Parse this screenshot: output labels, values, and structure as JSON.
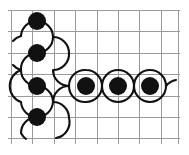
{
  "figure": {
    "type": "geometric-diagram",
    "canvas": {
      "width": 189,
      "height": 155,
      "background": "#ffffff"
    },
    "grid": {
      "line_color": "#9a9a9a",
      "line_width": 1,
      "cell_size": 21.4,
      "origin_x": 11.5,
      "origin_y": 10.5,
      "columns": 8,
      "rows": 6,
      "x_positions": [
        11.5,
        32.9,
        54.3,
        75.7,
        97.1,
        118.5,
        139.9,
        161.3,
        178.0
      ],
      "y_positions": [
        10.5,
        31.9,
        53.3,
        74.7,
        96.1,
        117.5,
        138.9
      ]
    },
    "curve": {
      "stroke_color": "#111111",
      "stroke_width": 2.1,
      "arc_radius": 16.0,
      "description": "Chain of semicircular arcs alternating above and below, forming a serpentine path"
    },
    "dots": {
      "fill_color": "#111111",
      "radius": 9.0,
      "count": 7,
      "positions": [
        {
          "label": "dot-1",
          "x": 37,
          "y": 21
        },
        {
          "label": "dot-2",
          "x": 37,
          "y": 53
        },
        {
          "label": "dot-3",
          "x": 37,
          "y": 86
        },
        {
          "label": "dot-4",
          "x": 37,
          "y": 117
        },
        {
          "label": "dot-5",
          "x": 86,
          "y": 86
        },
        {
          "label": "dot-6",
          "x": 118,
          "y": 86
        },
        {
          "label": "dot-7",
          "x": 150,
          "y": 86
        }
      ]
    },
    "paths": {
      "vertical_serpentine_left": "M 21 36 A 16 16 0 0 1 37 21 A 16 16 0 0 1 53 37 A 16 16 0 0 1 37 53 A 16 16 0 0 0 21 70 A 16 16 0 0 0 37 86 A 16 16 0 0 1 53 102 A 16 16 0 0 1 37 117 A 16 16 0 0 0 21 133 A 16 16 0 0 0 26 139",
      "vertical_serpentine_right": "M 53 37 A 16 16 0 0 1 69 53 A 16 16 0 0 1 53 70 A 16 16 0 0 0 69 86 A 16 16 0 0 0 53 102 A 16 16 0 0 1 69 118 A 16 16 0 0 1 56 138",
      "horizontal_wave_top": "M 69 86 A 16 16 0 0 1 86 70 A 16 16 0 0 1 102 86 A 16 16 0 0 1 118 70 A 16 16 0 0 1 134 86 A 16 16 0 0 1 150 70 A 16 16 0 0 1 166 86 A 16 16 0 0 1 176 80",
      "horizontal_wave_bottom": "M 69 86 A 16 16 0 0 0 86 102 A 16 16 0 0 0 102 86 A 16 16 0 0 0 118 102 A 16 16 0 0 0 134 86 A 16 16 0 0 0 150 102 A 16 16 0 0 0 166 86",
      "tail_upper_left": "M 21 36 A 16 16 0 0 0 13 41",
      "tail_lower_left": "M 21 70 A 16 16 0 0 1 13 65",
      "loop_left_mid": "M 21 70 A 17 17 0 0 0 21 102 A 16 16 0 0 0 37 117"
    }
  }
}
